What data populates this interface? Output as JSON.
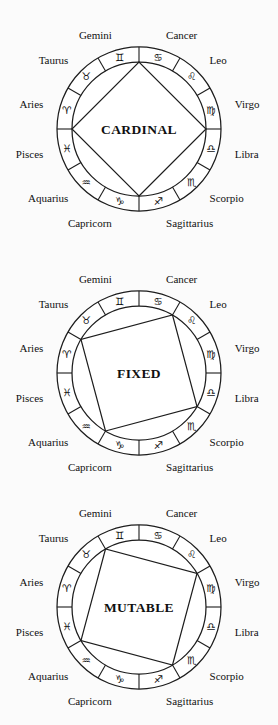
{
  "page": {
    "background_color": "#fbfbfb",
    "ink_color": "#1d1d1d",
    "width": 278,
    "height": 725
  },
  "signs": [
    {
      "name": "Aries",
      "glyph": "♈",
      "glyph_name": "aries-glyph",
      "index": 0
    },
    {
      "name": "Taurus",
      "glyph": "♉",
      "glyph_name": "taurus-glyph",
      "index": 1
    },
    {
      "name": "Gemini",
      "glyph": "♊",
      "glyph_name": "gemini-glyph",
      "index": 2
    },
    {
      "name": "Cancer",
      "glyph": "♋",
      "glyph_name": "cancer-glyph",
      "index": 3
    },
    {
      "name": "Leo",
      "glyph": "♌",
      "glyph_name": "leo-glyph",
      "index": 4
    },
    {
      "name": "Virgo",
      "glyph": "♍",
      "glyph_name": "virgo-glyph",
      "index": 5
    },
    {
      "name": "Libra",
      "glyph": "♎",
      "glyph_name": "libra-glyph",
      "index": 6
    },
    {
      "name": "Scorpio",
      "glyph": "♏",
      "glyph_name": "scorpio-glyph",
      "index": 7
    },
    {
      "name": "Sagittarius",
      "glyph": "♐",
      "glyph_name": "sagittarius-glyph",
      "index": 8
    },
    {
      "name": "Capricorn",
      "glyph": "♑",
      "glyph_name": "capricorn-glyph",
      "index": 9
    },
    {
      "name": "Aquarius",
      "glyph": "♒",
      "glyph_name": "aquarius-glyph",
      "index": 10
    },
    {
      "name": "Pisces",
      "glyph": "♓",
      "glyph_name": "pisces-glyph",
      "index": 11
    }
  ],
  "wheels": [
    {
      "id": "cardinal",
      "title": "CARDINAL",
      "top": 12,
      "shape": "quadrangle",
      "member_signs": [
        "Capricorn",
        "Aries",
        "Cancer",
        "Libra"
      ],
      "vertex_signs": [
        "Capricorn",
        "Libra",
        "Cancer",
        "Aries"
      ]
    },
    {
      "id": "fixed",
      "title": "FIXED",
      "top": 256,
      "shape": "square",
      "member_signs": [
        "Aquarius",
        "Taurus",
        "Leo",
        "Scorpio"
      ],
      "vertex_signs": [
        "Aquarius",
        "Scorpio",
        "Leo",
        "Taurus"
      ]
    },
    {
      "id": "mutable",
      "title": "MUTABLE",
      "top": 490,
      "shape": "quadrangle",
      "member_signs": [
        "Pisces",
        "Gemini",
        "Virgo",
        "Sagittarius"
      ],
      "vertex_signs": [
        "Sagittarius",
        "Virgo",
        "Gemini",
        "Pisces"
      ]
    }
  ],
  "geometry": {
    "center_x": 139,
    "center_y": 117,
    "outer_radius": 82,
    "inner_radius": 67,
    "label_radius": 97,
    "glyph_radius": 74.5,
    "sector_count": 12,
    "start_angle_deg": 180
  }
}
